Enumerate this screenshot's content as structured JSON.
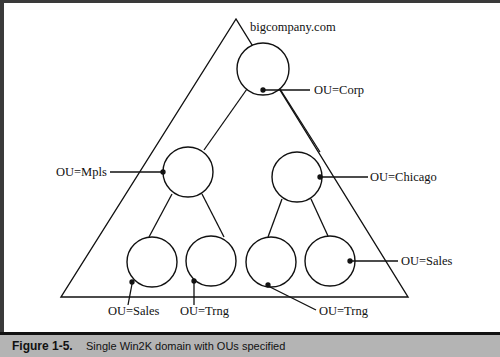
{
  "diagram": {
    "domain_label": "bigcompany.com",
    "ou_labels": {
      "corp": "OU=Corp",
      "mpls": "OU=Mpls",
      "chicago": "OU=Chicago",
      "mpls_sales": "OU=Sales",
      "mpls_trng": "OU=Trng",
      "chicago_trng": "OU=Trng",
      "chicago_sales": "OU=Sales"
    },
    "colors": {
      "stroke": "#111111",
      "caption_bg": "#b4b4b4"
    }
  },
  "caption": {
    "label": "Figure 1-5.",
    "text": "Single Win2K domain with OUs specified"
  }
}
